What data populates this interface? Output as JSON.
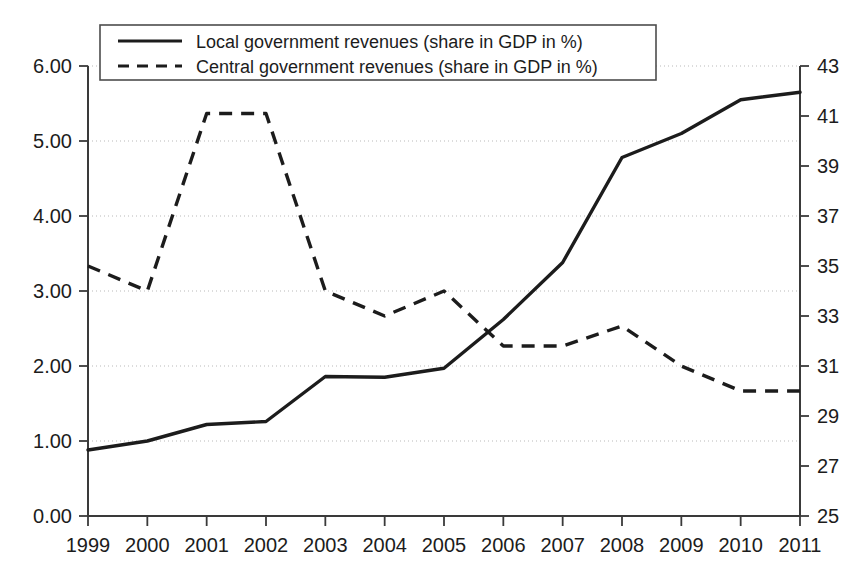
{
  "chart_data": {
    "type": "line",
    "title": "",
    "subtitle": "",
    "xlabel": "",
    "ylabel": "",
    "y2label": "",
    "grid": true,
    "legend_position": "top-left",
    "categories": [
      "1999",
      "2000",
      "2001",
      "2002",
      "2003",
      "2004",
      "2005",
      "2006",
      "2007",
      "2008",
      "2009",
      "2010",
      "2011"
    ],
    "x": [
      1999,
      2000,
      2001,
      2002,
      2003,
      2004,
      2005,
      2006,
      2007,
      2008,
      2009,
      2010,
      2011
    ],
    "ylim": [
      0.0,
      6.0
    ],
    "yticks": [
      0.0,
      1.0,
      2.0,
      3.0,
      4.0,
      5.0,
      6.0
    ],
    "ytick_labels": [
      "0.00",
      "1.00",
      "2.00",
      "3.00",
      "4.00",
      "5.00",
      "6.00"
    ],
    "y2lim": [
      25,
      43
    ],
    "y2ticks": [
      25,
      27,
      29,
      31,
      33,
      35,
      37,
      39,
      41,
      43
    ],
    "y2tick_labels": [
      "25",
      "27",
      "29",
      "31",
      "33",
      "35",
      "37",
      "39",
      "41",
      "43"
    ],
    "series": [
      {
        "name": "Local government revenues (share in GDP in %)",
        "axis": "left",
        "style": "solid",
        "legend_key": "solid-line-swatch",
        "values": [
          0.88,
          1.0,
          1.22,
          1.26,
          1.86,
          1.85,
          1.97,
          2.62,
          3.38,
          4.78,
          5.1,
          5.55,
          5.65
        ]
      },
      {
        "name": "Central government revenues (share in GDP in %)",
        "axis": "right",
        "style": "dashed",
        "legend_key": "dashed-line-swatch",
        "values": [
          35.0,
          34.0,
          41.1,
          41.1,
          34.0,
          33.0,
          34.0,
          31.8,
          31.8,
          32.6,
          31.0,
          30.0,
          30.0
        ]
      }
    ]
  },
  "legend": {
    "entries": [
      {
        "label": "Local government revenues (share in GDP in %)",
        "style": "solid"
      },
      {
        "label": "Central government revenues (share in GDP in %)",
        "style": "dashed"
      }
    ]
  }
}
